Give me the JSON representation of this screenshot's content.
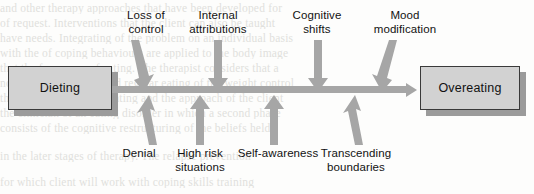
{
  "diagram": {
    "start_node": {
      "label": "Dieting"
    },
    "end_node": {
      "label": "Overeating"
    },
    "main_arrow": {
      "direction": "left-to-right",
      "color": "#a6a6a6"
    },
    "top_factors": [
      {
        "label": "Loss of\ncontrol",
        "arrow": "down-arrow-slanted",
        "x": 146
      },
      {
        "label": "Internal\nattributions",
        "arrow": "down-arrow-vertical",
        "x": 218
      },
      {
        "label": "Cognitive\nshifts",
        "arrow": "down-arrow-vertical",
        "x": 317
      },
      {
        "label": "Mood\nmodification",
        "arrow": "down-arrow-slanted",
        "x": 385
      }
    ],
    "bottom_factors": [
      {
        "label": "Denial",
        "arrow": "up-arrow-slanted",
        "x": 139
      },
      {
        "label": "High risk\nsituations",
        "arrow": "up-arrow-vertical",
        "x": 200
      },
      {
        "label": "Self-awareness",
        "arrow": "up-arrow-vertical",
        "x": 274
      },
      {
        "label": "Transcending\nboundaries",
        "arrow": "up-arrow-slanted",
        "x": 347
      }
    ],
    "colors": {
      "arrow_gray": "#a6a6a6",
      "box_fill": "#d2d2d2",
      "box_border": "#3a3a3a",
      "box_shadow": "#9b9b9b",
      "text": "#121212"
    }
  },
  "page_bleedthrough": {
    "lines": [
      "and other therapy approaches that have been developed for",
      "of request. Interventions that the client can also be taught",
      "have needs. Integrating of the problem on an individual basis",
      "with the of coping behaviours are applied to the body image",
      "that the frequency of eating. The therapist considers that a",
      "normal identification and regular eating of the weight control",
      "the treatment of binge eating and the approach of the client",
      "the clinician of an eating disorder in which a second phase",
      "consists of the cognitive restructuring of the beliefs held",
      "in the later stages of therapy. The relapse prevention",
      "for which client will work with coping skills training"
    ]
  },
  "caption": {
    "text": "FIGURE 6.11"
  }
}
